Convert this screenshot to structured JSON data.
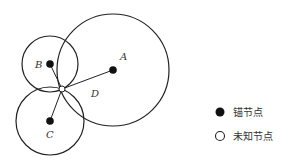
{
  "diagram": {
    "anchors": [
      {
        "id": "A",
        "label": "A",
        "cx": 113,
        "cy": 70,
        "r": 56,
        "label_x": 120,
        "label_y": 60
      },
      {
        "id": "B",
        "label": "B",
        "cx": 50,
        "cy": 64,
        "r": 28,
        "label_x": 36,
        "label_y": 67
      },
      {
        "id": "C",
        "label": "C",
        "cx": 50,
        "cy": 121,
        "r": 34,
        "label_x": 46,
        "label_y": 137
      }
    ],
    "unknown": {
      "id": "D",
      "label": "D",
      "cx": 62,
      "cy": 89,
      "label_x": 92,
      "label_y": 97
    },
    "colors": {
      "stroke": "#222222",
      "fill": "#111111",
      "background": "#ffffff"
    }
  },
  "legend": {
    "items": [
      {
        "symbol": "filled-circle",
        "label": "锚节点"
      },
      {
        "symbol": "open-circle",
        "label": "未知节点"
      }
    ]
  }
}
